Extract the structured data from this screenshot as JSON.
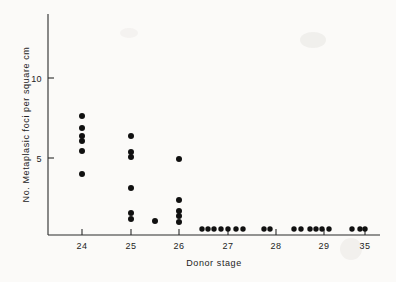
{
  "figure": {
    "background_color": "#fbfaf8",
    "ink_color": "#101010"
  },
  "chart_data": {
    "type": "scatter",
    "title": "",
    "xlabel": "Donor stage",
    "ylabel": "No. Metaplasic foci per square cm",
    "x_tick_labels": [
      "24",
      "25",
      "26",
      "27",
      "28",
      "29",
      "35"
    ],
    "x_categories": [
      24,
      25,
      26,
      27,
      28,
      29,
      35
    ],
    "y_tick_labels": [
      "5",
      "10"
    ],
    "y_ticks": [
      5,
      10
    ],
    "ylim": [
      0,
      13.5
    ],
    "grid": false,
    "legend": "none",
    "series": [
      {
        "name": "Metaplasic foci",
        "points": [
          {
            "stage": "24",
            "value": 7.4
          },
          {
            "stage": "24",
            "value": 6.6
          },
          {
            "stage": "24",
            "value": 6.1
          },
          {
            "stage": "24",
            "value": 5.9
          },
          {
            "stage": "24",
            "value": 5.3
          },
          {
            "stage": "24",
            "value": 3.9
          },
          {
            "stage": "25",
            "value": 6.2
          },
          {
            "stage": "25",
            "value": 5.3
          },
          {
            "stage": "25",
            "value": 5.1
          },
          {
            "stage": "25",
            "value": 3.3
          },
          {
            "stage": "25",
            "value": 1.5
          },
          {
            "stage": "25",
            "value": 1.1
          },
          {
            "stage": "25.5",
            "value": 0.9
          },
          {
            "stage": "26",
            "value": 4.9
          },
          {
            "stage": "26",
            "value": 2.4
          },
          {
            "stage": "26",
            "value": 1.7
          },
          {
            "stage": "26",
            "value": 1.5
          },
          {
            "stage": "26",
            "value": 1.0
          },
          {
            "stage": "27",
            "value": 0.0
          },
          {
            "stage": "27",
            "value": 0.0
          },
          {
            "stage": "27",
            "value": 0.0
          },
          {
            "stage": "27",
            "value": 0.0
          },
          {
            "stage": "27",
            "value": 0.0
          },
          {
            "stage": "27",
            "value": 0.0
          },
          {
            "stage": "27",
            "value": 0.0
          },
          {
            "stage": "28",
            "value": 0.0
          },
          {
            "stage": "28",
            "value": 0.0
          },
          {
            "stage": "28",
            "value": 0.0
          },
          {
            "stage": "29",
            "value": 0.0
          },
          {
            "stage": "29",
            "value": 0.0
          },
          {
            "stage": "29",
            "value": 0.0
          },
          {
            "stage": "29",
            "value": 0.0
          },
          {
            "stage": "29",
            "value": 0.0
          },
          {
            "stage": "29",
            "value": 0.0
          },
          {
            "stage": "29",
            "value": 0.0
          },
          {
            "stage": "35",
            "value": 0.0
          },
          {
            "stage": "35",
            "value": 0.0
          },
          {
            "stage": "35",
            "value": 0.0
          },
          {
            "stage": "35",
            "value": 0.0
          }
        ]
      }
    ],
    "point_pixels": [
      {
        "cx": 82,
        "cy": 116,
        "r": 3.0
      },
      {
        "cx": 82,
        "cy": 128,
        "r": 3.0
      },
      {
        "cx": 82,
        "cy": 136,
        "r": 3.0
      },
      {
        "cx": 82,
        "cy": 141,
        "r": 3.0
      },
      {
        "cx": 82,
        "cy": 151,
        "r": 3.0
      },
      {
        "cx": 82,
        "cy": 174,
        "r": 3.0
      },
      {
        "cx": 131,
        "cy": 136,
        "r": 3.0
      },
      {
        "cx": 131,
        "cy": 152,
        "r": 3.0
      },
      {
        "cx": 131,
        "cy": 157,
        "r": 3.0
      },
      {
        "cx": 131,
        "cy": 188,
        "r": 3.0
      },
      {
        "cx": 131,
        "cy": 213,
        "r": 3.0
      },
      {
        "cx": 131,
        "cy": 219,
        "r": 3.0
      },
      {
        "cx": 155,
        "cy": 221,
        "r": 3.0
      },
      {
        "cx": 179,
        "cy": 159,
        "r": 3.0
      },
      {
        "cx": 179,
        "cy": 200,
        "r": 3.0
      },
      {
        "cx": 179,
        "cy": 211,
        "r": 3.0
      },
      {
        "cx": 179,
        "cy": 216,
        "r": 3.0
      },
      {
        "cx": 179,
        "cy": 222,
        "r": 3.0
      },
      {
        "cx": 202,
        "cy": 229,
        "r": 2.7
      },
      {
        "cx": 208,
        "cy": 229,
        "r": 2.7
      },
      {
        "cx": 214,
        "cy": 229,
        "r": 2.7
      },
      {
        "cx": 221,
        "cy": 229,
        "r": 2.7
      },
      {
        "cx": 228,
        "cy": 229,
        "r": 2.7
      },
      {
        "cx": 236,
        "cy": 229,
        "r": 2.7
      },
      {
        "cx": 243,
        "cy": 229,
        "r": 2.7
      },
      {
        "cx": 264,
        "cy": 229,
        "r": 2.7
      },
      {
        "cx": 270,
        "cy": 229,
        "r": 2.7
      },
      {
        "cx": 294,
        "cy": 229,
        "r": 2.7
      },
      {
        "cx": 301,
        "cy": 229,
        "r": 2.7
      },
      {
        "cx": 310,
        "cy": 229,
        "r": 2.7
      },
      {
        "cx": 316,
        "cy": 229,
        "r": 2.7
      },
      {
        "cx": 322,
        "cy": 229,
        "r": 2.7
      },
      {
        "cx": 329,
        "cy": 229,
        "r": 2.7
      },
      {
        "cx": 352,
        "cy": 229,
        "r": 2.7
      },
      {
        "cx": 360,
        "cy": 229,
        "r": 2.7
      },
      {
        "cx": 365,
        "cy": 229,
        "r": 2.7
      }
    ],
    "axes_pixels": {
      "x_axis_y": 235,
      "y_axis_x": 48,
      "y_axis_top": 14,
      "x_axis_right": 380,
      "x_tick_positions": [
        82,
        131,
        179,
        228,
        276,
        324,
        365
      ],
      "y_tick_positions": [
        {
          "label": "5",
          "y": 158
        },
        {
          "label": "10",
          "y": 78
        }
      ]
    }
  }
}
